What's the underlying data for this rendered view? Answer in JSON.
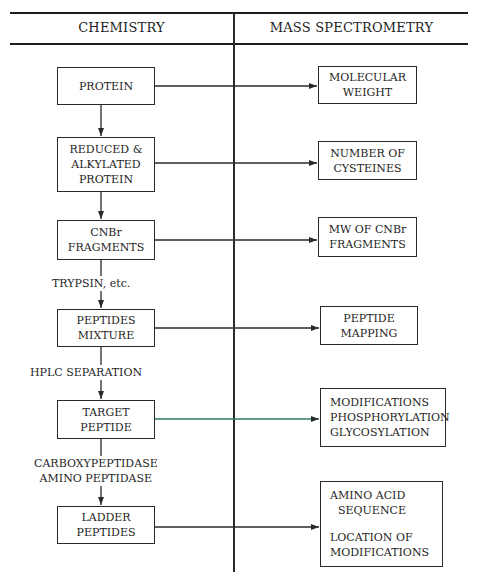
{
  "header": {
    "left_title": "CHEMISTRY",
    "right_title": "MASS SPECTROMETRY"
  },
  "chemistry": {
    "boxes": [
      {
        "lines": [
          "PROTEIN"
        ]
      },
      {
        "lines": [
          "REDUCED &",
          "ALKYLATED",
          "PROTEIN"
        ]
      },
      {
        "lines": [
          "CNBr",
          "FRAGMENTS"
        ]
      },
      {
        "lines": [
          "PEPTIDES",
          "MIXTURE"
        ]
      },
      {
        "lines": [
          "TARGET",
          "PEPTIDE"
        ]
      },
      {
        "lines": [
          "LADDER",
          "PEPTIDES"
        ]
      }
    ],
    "steps": [
      {
        "lines": [
          "TRYPSIN, etc."
        ]
      },
      {
        "lines": [
          "HPLC SEPARATION"
        ]
      },
      {
        "lines": [
          "CARBOXYPEPTIDASE",
          "AMINO PEPTIDASE"
        ]
      }
    ]
  },
  "mass_spectrometry": {
    "boxes": [
      {
        "lines": [
          "MOLECULAR",
          "WEIGHT"
        ]
      },
      {
        "lines": [
          "NUMBER OF",
          "CYSTEINES"
        ]
      },
      {
        "lines": [
          "MW OF CNBr",
          "FRAGMENTS"
        ]
      },
      {
        "lines": [
          "PEPTIDE",
          "MAPPING"
        ]
      },
      {
        "lines": [
          "MODIFICATIONS",
          "PHOSPHORYLATION",
          "GLYCOSYLATION"
        ]
      },
      {
        "lines": [
          "AMINO ACID",
          "SEQUENCE",
          "",
          "LOCATION OF",
          "MODIFICATIONS"
        ]
      }
    ]
  },
  "colors": {
    "line": "#2a2a2a",
    "text": "#1e1e1e",
    "target_connector": "#2e7d5a",
    "background": "#ffffff"
  }
}
